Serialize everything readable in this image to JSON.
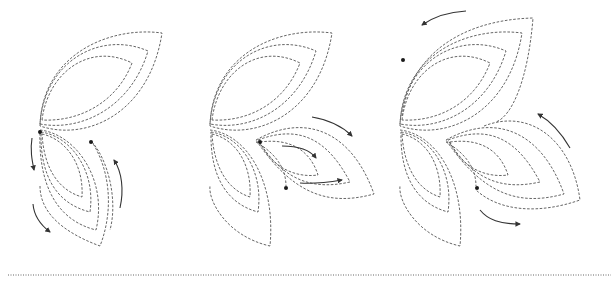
{
  "diagram": {
    "type": "quilting-stitch-path-steps",
    "panels": [
      {
        "step": 1,
        "description": "Top leaf echoes and lower-left leaf echoes; stitch down left side and up right side",
        "leaves": [
          "top",
          "bottom-left"
        ],
        "arrows": [
          "down-left-upper",
          "down-left-lower",
          "up-right"
        ],
        "dots": 2
      },
      {
        "step": 2,
        "description": "Adds right leaf echoes; stitch out along right leaf",
        "leaves": [
          "top",
          "bottom-left",
          "right"
        ],
        "arrows": [
          "right-outer",
          "right-inner",
          "right-lower"
        ],
        "dots": 2
      },
      {
        "step": 3,
        "description": "Full motif with outer echo around top leaf and right leaf",
        "leaves": [
          "top",
          "bottom-left",
          "right"
        ],
        "arrows": [
          "top-left-counterclockwise",
          "right-up",
          "bottom-right"
        ],
        "dots": 2
      }
    ],
    "colors": {
      "stroke": "#555555",
      "arrow": "#333333",
      "dot": "#1a1a1a",
      "background": "#ffffff"
    },
    "separator": "dotted-line"
  }
}
